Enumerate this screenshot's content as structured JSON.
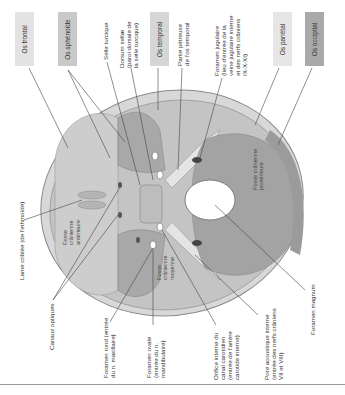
{
  "bone_boxes": [
    {
      "id": "frontal",
      "label": "Os frontal",
      "color": "#e3e3e3"
    },
    {
      "id": "sphenoide",
      "label": "Os sphénoïde",
      "color": "#c9c9c9"
    },
    {
      "id": "temporal",
      "label": "Os temporal",
      "color": "#d6d6d6"
    },
    {
      "id": "parietal",
      "label": "Os pariétal",
      "color": "#e6e6e6"
    },
    {
      "id": "occipital",
      "label": "Os occipital",
      "color": "#a9a9a9"
    }
  ],
  "top_labels": {
    "selle_turcique": "Selle turcique",
    "dorsum_sellae": "Dorsum sellæ\n(paroi dorsale de\nla selle turcique)",
    "partie_petreuse": "Partie pétreuse\nde l'os temporal",
    "foramen_jugulaire": "Foramen jugulaire\n(lieu d'entrée de la\nveine jugulaire interne\net des nerfs crâniens\nIX-X-XI)"
  },
  "left_labels": {
    "lame_criblee": "Lame criblée (de l'ethmoïde)"
  },
  "bottom_labels": {
    "canaux_optiques": "Canaux optiques",
    "foramen_rond": "Foramen rond (entrée\ndu n. maxillaire)",
    "foramen_ovale": "Foramen ovale\n(entrée du n.\nmandibulaire)",
    "orifice_carotidien": "Orifice interne du\ncanal carotidien\n(entrée de l'artère\ncarotide interne)",
    "pore_acoustique": "Pore acoustique interne\n(entrée des nerfs crâniens\nVII et VIII)",
    "foramen_magnum": "Foramen magnum"
  },
  "inner_labels": {
    "fosse_anterieure": "Fosse\ncrânienne\nantérieure",
    "fosse_moyenne": "Fosse\ncrânienne\nmoyenne",
    "fosse_posterieure": "Fosse crânienne\npostérieure"
  },
  "colors": {
    "skull_outer": "#cfcfcf",
    "skull_fill": "#bdbdbd",
    "fossa_dark": "#9e9e9e",
    "foramen": "#ffffff",
    "leader_line": "#444444"
  }
}
